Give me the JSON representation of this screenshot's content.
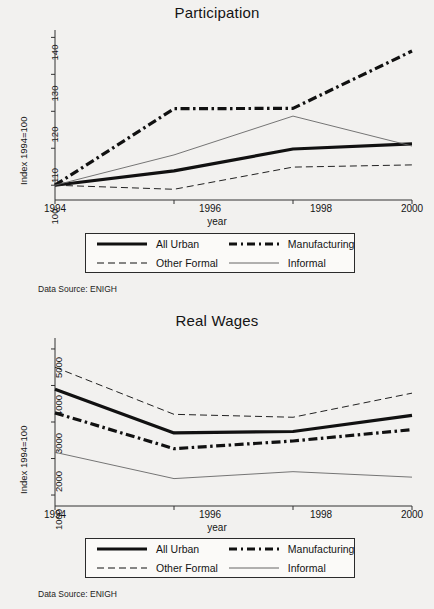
{
  "figures": [
    {
      "key": "participation",
      "title": "Participation",
      "xlabel": "year",
      "ylabel": "Index 1994=100",
      "source": "Data Source: ENIGH",
      "yticks": [
        "100",
        "110",
        "120",
        "130",
        "140"
      ],
      "xticks": [
        "1994",
        "1996",
        "1998",
        "2000"
      ],
      "legend": [
        {
          "label": "All Urban",
          "style": "thick-solid"
        },
        {
          "label": "Manufacturing",
          "style": "thick-dashdot"
        },
        {
          "label": "Other Formal",
          "style": "thin-dashed"
        },
        {
          "label": "Informal",
          "style": "thin-solid"
        }
      ]
    },
    {
      "key": "wages",
      "title": "Real Wages",
      "xlabel": "year",
      "ylabel": "Index 1994=100",
      "source": "Data Source: ENIGH",
      "yticks": [
        "1000",
        "2000",
        "3000",
        "4000",
        "5000"
      ],
      "xticks": [
        "1994",
        "1996",
        "1998",
        "2000"
      ],
      "legend": [
        {
          "label": "All Urban",
          "style": "thick-solid"
        },
        {
          "label": "Manufacturing",
          "style": "thick-dashdot"
        },
        {
          "label": "Other Formal",
          "style": "thin-dashed"
        },
        {
          "label": "Informal",
          "style": "thin-solid"
        }
      ]
    }
  ],
  "chart_data": [
    {
      "type": "line",
      "title": "Participation",
      "xlabel": "year",
      "ylabel": "Index 1994=100",
      "x": [
        1994,
        1996,
        1998,
        2000
      ],
      "xlim": [
        1994,
        2000
      ],
      "ylim": [
        96,
        142
      ],
      "yticks": [
        100,
        110,
        120,
        130,
        140
      ],
      "xticks": [
        1994,
        1996,
        1998,
        2000
      ],
      "grid": false,
      "legend_position": "below-axes",
      "annotation": "Data Source: ENIGH",
      "series": [
        {
          "name": "All Urban",
          "style": "thick-solid",
          "values": [
            100,
            103.9,
            109.8,
            111.2
          ]
        },
        {
          "name": "Manufacturing",
          "style": "thick-dashdot",
          "values": [
            100,
            120.7,
            120.8,
            136.3
          ]
        },
        {
          "name": "Other Formal",
          "style": "thin-dashed",
          "values": [
            100,
            98.9,
            104.9,
            105.5
          ]
        },
        {
          "name": "Informal",
          "style": "thin-solid",
          "values": [
            100,
            108.2,
            118.7,
            110.6
          ]
        }
      ]
    },
    {
      "type": "line",
      "title": "Real Wages",
      "xlabel": "year",
      "ylabel": "Index 1994=100",
      "x": [
        1994,
        1996,
        1998,
        2000
      ],
      "xlim": [
        1994,
        2000
      ],
      "ylim": [
        700,
        5300
      ],
      "yticks": [
        1000,
        2000,
        3000,
        4000,
        5000
      ],
      "xticks": [
        1994,
        1996,
        1998,
        2000
      ],
      "grid": false,
      "legend_position": "below-axes",
      "annotation": "Data Source: ENIGH",
      "series": [
        {
          "name": "All Urban",
          "style": "thick-solid",
          "values": [
            3900,
            2700,
            2740,
            3180
          ]
        },
        {
          "name": "Manufacturing",
          "style": "thick-dashdot",
          "values": [
            3250,
            2270,
            2480,
            2790
          ]
        },
        {
          "name": "Other Formal",
          "style": "thin-dashed",
          "values": [
            4500,
            3210,
            3130,
            3790
          ]
        },
        {
          "name": "Informal",
          "style": "thin-solid",
          "values": [
            2170,
            1450,
            1640,
            1490
          ]
        }
      ]
    }
  ]
}
